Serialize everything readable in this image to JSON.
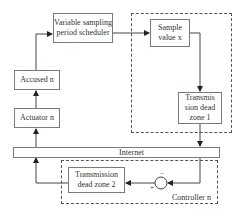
{
  "diagram": {
    "nodes": {
      "scheduler": "Variable sampling period scheduler",
      "accused": "Accused n",
      "actuator": "Actuator n",
      "sample": "Sample value x",
      "dz1": "Transmis sion dead zone 1",
      "internet": "Internet",
      "dz2": "Transmission dead zone 2",
      "controller": "Controller n",
      "sum_plus": "+",
      "sum_minus": "−"
    },
    "edges": [
      {
        "from": "actuator",
        "to": "accused"
      },
      {
        "from": "accused",
        "to": "scheduler"
      },
      {
        "from": "scheduler",
        "to": "sample"
      },
      {
        "from": "sample",
        "to": "dz1"
      },
      {
        "from": "dz1",
        "to": "internet"
      },
      {
        "from": "internet",
        "to": "sum"
      },
      {
        "from": "sum",
        "to": "dz2"
      },
      {
        "from": "dz2",
        "to": "internet"
      },
      {
        "from": "internet",
        "to": "actuator"
      }
    ],
    "groups": [
      {
        "name": "sensor-group",
        "contains": [
          "sample",
          "dz1"
        ]
      },
      {
        "name": "controller-group",
        "label": "Controller n",
        "contains": [
          "dz2",
          "sum"
        ]
      }
    ]
  }
}
